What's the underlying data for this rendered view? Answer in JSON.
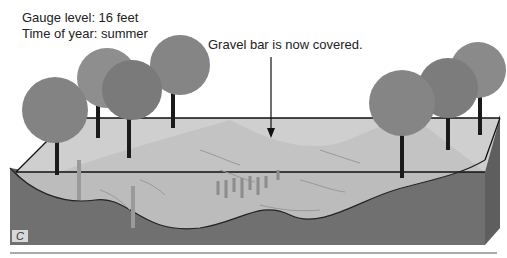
{
  "diagram": {
    "labels": {
      "gauge_level": "Gauge level: 16 feet",
      "time_of_year": "Time of year: summer",
      "callout": "Gravel bar is now covered.",
      "panel_letter": "C"
    },
    "colors": {
      "water_surface": "#d0d0d0",
      "gravel_bar": "#bdbdbd",
      "water_body": "#b8b8b8",
      "bedrock": "#6e6e6e",
      "tree_foliage": "#8a8a8a",
      "outline": "#111111"
    }
  }
}
